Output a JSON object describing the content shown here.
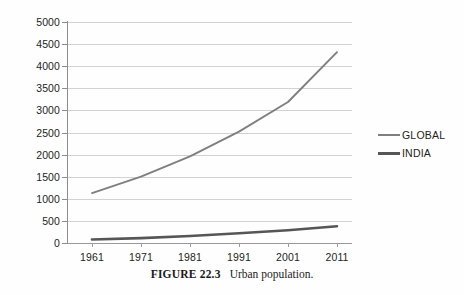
{
  "figure": {
    "caption_label": "FIGURE 22.3",
    "caption_text": "Urban population."
  },
  "legend": {
    "position": "right",
    "items": [
      {
        "label": "GLOBAL",
        "color": "#7f7f7f",
        "swatch": "line-swatch-icon"
      },
      {
        "label": "INDIA",
        "color": "#565656",
        "swatch": "line-swatch-icon"
      }
    ]
  },
  "axes": {
    "y_ticks": [
      "5000",
      "4500",
      "4000",
      "3500",
      "3000",
      "2500",
      "2000",
      "1500",
      "1000",
      "500",
      "0"
    ],
    "x_ticks": [
      "1961",
      "1971",
      "1981",
      "1991",
      "2001",
      "2011"
    ]
  },
  "chart_data": {
    "type": "line",
    "title": "",
    "xlabel": "",
    "ylabel": "",
    "categories": [
      "1961",
      "1971",
      "1981",
      "1991",
      "2001",
      "2011"
    ],
    "x": [
      1961,
      1971,
      1981,
      1991,
      2001,
      2011
    ],
    "series": [
      {
        "name": "GLOBAL",
        "color": "#7f7f7f",
        "values": [
          1130,
          1500,
          1960,
          2520,
          3190,
          4320
        ]
      },
      {
        "name": "INDIA",
        "color": "#565656",
        "values": [
          80,
          110,
          160,
          220,
          290,
          380
        ]
      }
    ],
    "ylim": [
      0,
      5000
    ],
    "ytick_step": 500,
    "xlim": [
      1961,
      2011
    ],
    "grid": true,
    "grid_axis": "y",
    "legend_position": "right"
  },
  "colors": {
    "grid": "#d2d2d2",
    "axis": "#8d8d8d",
    "text": "#231f20",
    "background": "#ffffff"
  }
}
